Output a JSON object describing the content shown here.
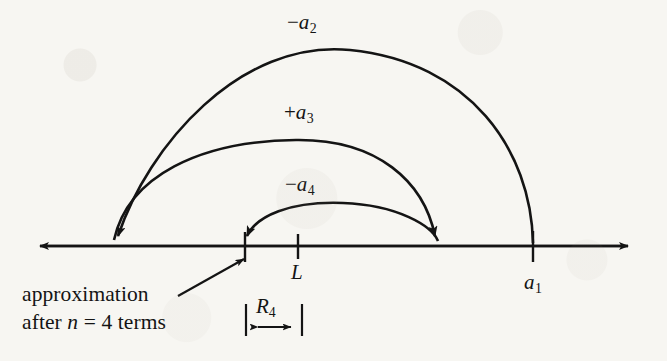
{
  "figure": {
    "type": "number-line-diagram",
    "background_color": "#f7f6f2",
    "ink_color": "#141414"
  },
  "axis": {
    "name": "number-line",
    "y": 246,
    "x_start": 30,
    "x_end": 638,
    "arrow_both_ends": true
  },
  "points": [
    {
      "id": "approximation",
      "label": "",
      "x": 245,
      "tick": true
    },
    {
      "id": "limit",
      "label": "L",
      "x": 298,
      "tick": true,
      "label_y": 262
    },
    {
      "id": "partial_sum_2",
      "label": "",
      "x": 438,
      "tick": false
    },
    {
      "id": "first_term",
      "label": "a",
      "sub": "1",
      "x": 533,
      "tick": true,
      "label_y": 272
    }
  ],
  "arcs": [
    {
      "id": "arc-a2",
      "label_sign": "−",
      "label_base": "a",
      "label_sub": "2",
      "label_x": 297,
      "label_y": 14,
      "from_x": 533,
      "to_x": 115,
      "peak_y": 50,
      "direction": "right-to-left"
    },
    {
      "id": "arc-a3",
      "label_sign": "+",
      "label_base": "a",
      "label_sub": "3",
      "label_x": 294,
      "label_y": 104,
      "from_x": 115,
      "to_x": 438,
      "peak_y": 140,
      "direction": "left-to-right"
    },
    {
      "id": "arc-a4",
      "label_sign": "−",
      "label_base": "a",
      "label_sub": "4",
      "label_x": 295,
      "label_y": 176,
      "from_x": 438,
      "to_x": 245,
      "peak_y": 203,
      "direction": "right-to-left"
    }
  ],
  "caption": {
    "name": "approximation-caption",
    "line1": "approximation",
    "line2_prefix": "after ",
    "line2_italic": "n",
    "line2_suffix": " = 4 terms",
    "x": 22,
    "line1_y": 286,
    "line2_y": 314,
    "pointer": {
      "from_x": 178,
      "from_y": 296,
      "to_x": 247,
      "to_y": 257
    }
  },
  "remainder": {
    "name": "remainder-measure",
    "label_base": "R",
    "label_sub": "4",
    "label_x": 258,
    "label_y": 300,
    "left_bar_x": 246,
    "right_bar_x": 301,
    "bar_top": 303,
    "bar_bottom": 334,
    "arrow_y": 327
  }
}
